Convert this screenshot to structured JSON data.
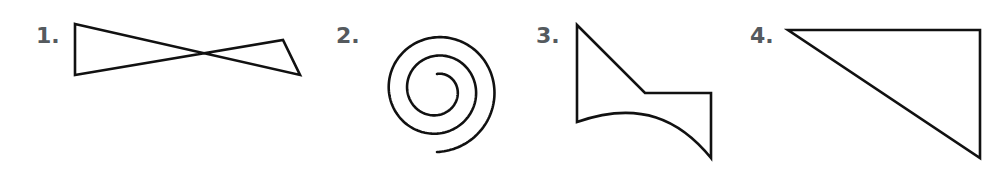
{
  "figures": [
    {
      "label": "1.",
      "shape": "bowtie",
      "description": "self-intersecting quadrilateral (crossed shape)"
    },
    {
      "label": "2.",
      "shape": "spiral",
      "description": "open spiral curve"
    },
    {
      "label": "3.",
      "shape": "curved-polygon",
      "description": "closed shape with one curved side"
    },
    {
      "label": "4.",
      "shape": "right-triangle",
      "description": "right triangle"
    }
  ],
  "colors": {
    "stroke": "#111111",
    "label": "#555a5e",
    "background": "#ffffff"
  }
}
